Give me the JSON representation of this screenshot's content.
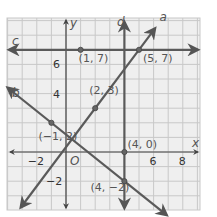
{
  "graph": {
    "x_range": [
      -4,
      9
    ],
    "y_range": [
      -4,
      9
    ],
    "axis_labels": {
      "x": "x",
      "y": "y",
      "origin": "O"
    },
    "x_ticks": [
      {
        "value": -2,
        "label": "−2"
      },
      {
        "value": 6,
        "label": "6"
      },
      {
        "value": 8,
        "label": "8"
      }
    ],
    "y_ticks": [
      {
        "value": 6,
        "label": "6"
      },
      {
        "value": 4,
        "label": "4"
      },
      {
        "value": -2,
        "label": "−2"
      }
    ],
    "lines": [
      {
        "name": "a",
        "description": "line through (2,3) and (5,7)"
      },
      {
        "name": "b",
        "description": "line through (-1,2) and (4,-2)"
      },
      {
        "name": "c",
        "description": "horizontal line y=7 through (1,7) and (5,7)"
      },
      {
        "name": "d",
        "description": "vertical line x=4 through (4,0) and (4,-2)"
      }
    ],
    "points": [
      {
        "label": "(1, 7)",
        "x": 1,
        "y": 7
      },
      {
        "label": "(5, 7)",
        "x": 5,
        "y": 7
      },
      {
        "label": "(2, 3)",
        "x": 2,
        "y": 3
      },
      {
        "label": "(−1, 2)",
        "x": -1,
        "y": 2
      },
      {
        "label": "(4, 0)",
        "x": 4,
        "y": 0
      },
      {
        "label": "(4, −2)",
        "x": 4,
        "y": -2
      }
    ],
    "colors": {
      "grid_bg": "#efefef",
      "grid_line": "#c8c8c8",
      "line": "#5a5a5a",
      "axis": "#444444"
    }
  }
}
